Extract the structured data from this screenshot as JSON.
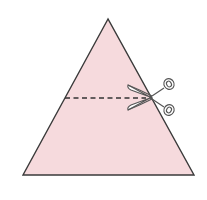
{
  "diagram": {
    "colors": {
      "triangle_fill": "#f6dadd",
      "outline": "#3a3a3a",
      "dash": "#333333",
      "scissors_fill": "#ffffff",
      "scissors_stroke": "#555555"
    },
    "triangle": {
      "apex": [
        108,
        19
      ],
      "base_left": [
        23,
        175
      ],
      "base_right": [
        194,
        175
      ]
    },
    "cut_line": {
      "y": 98,
      "x_start": 65,
      "x_end": 150
    },
    "scissors": {
      "position": [
        150,
        97
      ]
    }
  }
}
